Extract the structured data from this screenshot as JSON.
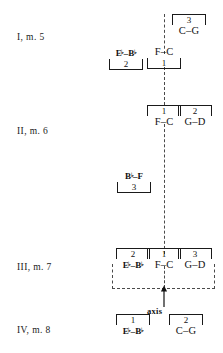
{
  "figure": {
    "background": "#ffffff",
    "ink": "#111111",
    "dash_color": "#4a4a4a"
  },
  "rows": [
    {
      "label": "I, m. 5"
    },
    {
      "label": "II, m. 6"
    },
    {
      "label": "III, m. 7"
    },
    {
      "label": "IV, m. 8"
    }
  ],
  "axis": {
    "caption": "axis",
    "orientation": "vertical-dashed"
  },
  "groups": {
    "g1": {
      "num": "3",
      "pitch": "C–G"
    },
    "g2": {
      "num": "2",
      "pitch": "E♭–B♭"
    },
    "g3": {
      "num": "1",
      "pitch": "F–C"
    },
    "g4": {
      "num": "1",
      "pitch": "F–C"
    },
    "g5": {
      "num": "2",
      "pitch": "G–D"
    },
    "g6": {
      "num": "3",
      "pitch": "B♭–F"
    },
    "g7": {
      "num": "2",
      "pitch": "E♭–B♭"
    },
    "g8": {
      "num": "1",
      "pitch": "F–C"
    },
    "g9": {
      "num": "3",
      "pitch": "G–D"
    },
    "g10": {
      "num": "1",
      "pitch": "E♭–B♭"
    },
    "g11": {
      "num": "2",
      "pitch": "C–G"
    }
  }
}
